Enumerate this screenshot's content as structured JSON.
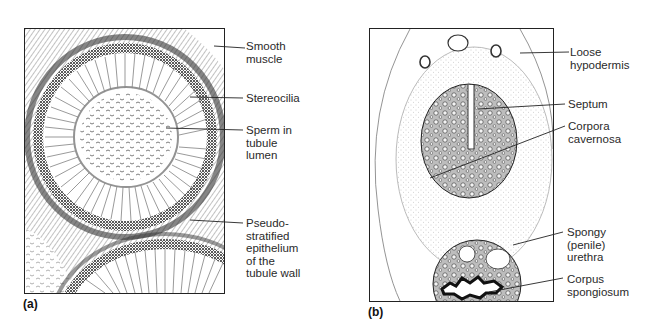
{
  "figure": {
    "panels": [
      {
        "tag": "(a)",
        "subject": "epididymis tubule cross-section",
        "labels": [
          {
            "text": "Smooth\nmuscle"
          },
          {
            "text": "Stereocilia"
          },
          {
            "text": "Sperm in\ntubule\nlumen"
          },
          {
            "text": "Pseudo-\nstratified\nepithelium\nof the\ntubule wall"
          }
        ]
      },
      {
        "tag": "(b)",
        "subject": "penis cross-section",
        "labels": [
          {
            "text": "Loose\nhypodermis"
          },
          {
            "text": "Septum"
          },
          {
            "text": "Corpora\ncavernosa"
          },
          {
            "text": "Spongy\n(penile)\nurethra"
          },
          {
            "text": "Corpus\nspongiosum"
          }
        ]
      }
    ]
  },
  "colors": {
    "ink": "#1a1a1a",
    "stipple": "#9a9a9a",
    "background": "#ffffff"
  }
}
